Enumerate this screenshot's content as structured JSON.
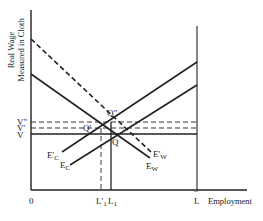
{
  "axes": {
    "y_label_line1": "Real Wage",
    "y_label_line2": "Measured in Cloth",
    "x_label": "Employment",
    "origin": "0",
    "x_max_label": "L",
    "x_max_bar": "¯"
  },
  "wage_levels": {
    "v2": "V\"",
    "v1": "V'",
    "v0": "V"
  },
  "employment_levels": {
    "l1_prime": "L'",
    "l1_prime_sub": "1",
    "l1": "L",
    "l1_sub": "1"
  },
  "points": {
    "q": "Q",
    "q_prime": "Q'",
    "q_double_prime": "Q\""
  },
  "curves": {
    "ec_prime": "E'",
    "ec_prime_sub": "C",
    "ec": "E",
    "ec_sub": "C",
    "ew_prime": "E'",
    "ew_prime_sub": "W",
    "ew": "E",
    "ew_sub": "W"
  },
  "colors": {
    "line": "#222222",
    "background": "#ffffff"
  }
}
